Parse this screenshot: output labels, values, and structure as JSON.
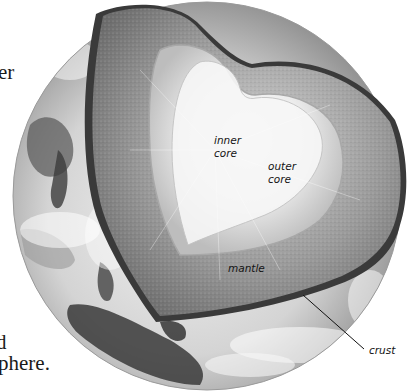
{
  "figure": {
    "labels": {
      "inner_core": [
        "inner",
        "core"
      ],
      "outer_core": [
        "outer",
        "core"
      ],
      "mantle": "mantle",
      "crust": "crust"
    }
  },
  "body_text_fragments": {
    "line_1": "er",
    "line_2": "d",
    "line_3": "phere."
  },
  "colors": {
    "background": "#ffffff",
    "globe_light": "#e6e6e6",
    "globe_dark": "#5a5a5a",
    "mantle": "#8c8c8c",
    "crust_band": "#3a3a3a",
    "outer_core": "#cfcfcf",
    "inner_core": "#f4f4f4",
    "label_text": "#141414"
  }
}
